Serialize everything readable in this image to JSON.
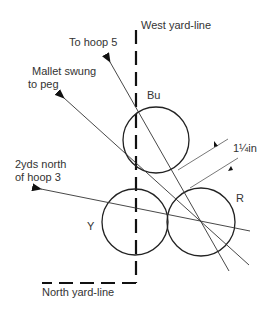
{
  "diagram": {
    "labels": {
      "west_yard_line": "West yard-line",
      "north_yard_line": "North yard-line",
      "to_hoop_5": "To hoop 5",
      "mallet_line1": "Mallet swung",
      "mallet_line2": "to peg",
      "hoop3_line1": "2yds north",
      "hoop3_line2": "of hoop 3",
      "measurement": "1¼in"
    },
    "balls": [
      {
        "id": "Bu",
        "label": "Bu",
        "cx": 156,
        "cy": 140,
        "r": 33
      },
      {
        "id": "Y",
        "label": "Y",
        "cx": 135,
        "cy": 222,
        "r": 33
      },
      {
        "id": "R",
        "label": "R",
        "cx": 201,
        "cy": 222,
        "r": 34
      }
    ],
    "colors": {
      "stroke": "#222222",
      "thin_stroke": "#444444",
      "text": "#333333",
      "background": "#ffffff"
    }
  }
}
